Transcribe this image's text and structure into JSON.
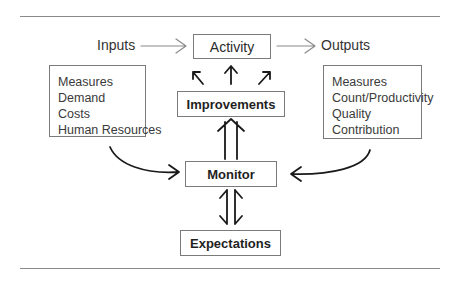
{
  "diagram": {
    "inputs_label": "Inputs",
    "outputs_label": "Outputs",
    "activity": "Activity",
    "improvements": "Improvements",
    "monitor": "Monitor",
    "expectations": "Expectations",
    "inputs_list": [
      "Measures",
      "Demand",
      "Costs",
      "Human Resources"
    ],
    "outputs_list": [
      "Measures",
      "Count/Productivity",
      "Quality",
      "Contribution"
    ],
    "line_color": "#8a8a8a",
    "arrow_color": "#1a1a1a"
  }
}
